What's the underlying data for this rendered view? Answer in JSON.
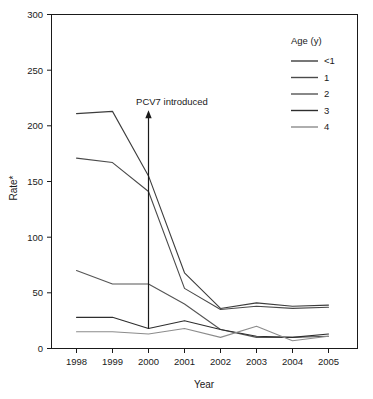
{
  "chart_data": {
    "type": "line",
    "title": "",
    "xlabel": "Year",
    "ylabel": "Rate*",
    "categories": [
      "1998",
      "1999",
      "2000",
      "2001",
      "2002",
      "2003",
      "2004",
      "2005"
    ],
    "x": [
      1998,
      1999,
      2000,
      2001,
      2002,
      2003,
      2004,
      2005
    ],
    "xlim": [
      1998,
      2005
    ],
    "ylim": [
      0,
      300
    ],
    "yticks": [
      0,
      50,
      100,
      150,
      200,
      250,
      300
    ],
    "xticks": [
      "1998",
      "1999",
      "2000",
      "2001",
      "2002",
      "2003",
      "2004",
      "2005"
    ],
    "grid": false,
    "legend_position": "top-right",
    "legend_title": "Age (y)",
    "series": [
      {
        "name": "<1",
        "color": "#3d3d3d",
        "values": [
          211,
          213,
          155,
          68,
          36,
          41,
          38,
          39
        ]
      },
      {
        "name": "1",
        "color": "#4a4a4a",
        "values": [
          171,
          167,
          141,
          54,
          35,
          38,
          36,
          37
        ]
      },
      {
        "name": "2",
        "color": "#555555",
        "values": [
          70,
          58,
          58,
          40,
          17,
          10,
          10,
          11
        ]
      },
      {
        "name": "3",
        "color": "#2e2e2e",
        "values": [
          28,
          28,
          18,
          25,
          17,
          11,
          10,
          13
        ]
      },
      {
        "name": "4",
        "color": "#8c8c8c",
        "values": [
          15,
          15,
          13,
          18,
          10,
          20,
          7,
          11
        ]
      }
    ],
    "annotations": [
      {
        "text": "PCV7 introduced",
        "x": 2000,
        "arrow": "up",
        "arrow_from_y": 18,
        "arrow_to_y": 213
      }
    ]
  },
  "axes": {
    "y_label": "Rate*",
    "x_label": "Year",
    "y_tick_labels": [
      "300",
      "250",
      "200",
      "150",
      "100",
      "50",
      "0"
    ],
    "x_tick_labels": [
      "1998",
      "1999",
      "2000",
      "2001",
      "2002",
      "2003",
      "2004",
      "2005"
    ]
  },
  "legend": {
    "title": "Age (y)",
    "items": [
      {
        "label": "<1"
      },
      {
        "label": "1"
      },
      {
        "label": "2"
      },
      {
        "label": "3"
      },
      {
        "label": "4"
      }
    ]
  },
  "annotation": {
    "label": "PCV7 introduced"
  }
}
